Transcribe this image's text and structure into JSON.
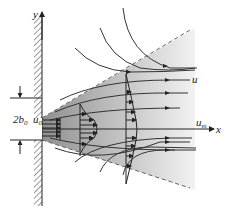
{
  "diagram": {
    "labels": {
      "y_axis": "y",
      "x_axis": "x",
      "width_label": "2b",
      "width_sub": "0",
      "inlet_velocity": "u",
      "inlet_velocity_sub": "0",
      "local_velocity": "u",
      "centerline_velocity": "u",
      "centerline_velocity_sub": "m"
    },
    "colors": {
      "jet_core": "#9a9a9a",
      "jet_outer": "#e6e6e6",
      "lines": "#333333",
      "dashed_boundary": "#777777"
    }
  }
}
